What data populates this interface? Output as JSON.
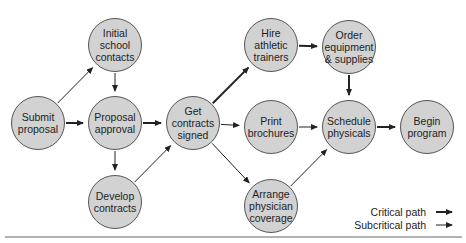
{
  "nodes": [
    {
      "id": "submit",
      "label": "Submit\nproposal",
      "cx": 38,
      "cy": 123
    },
    {
      "id": "initial",
      "label": "Initial\nschool\ncontacts",
      "cx": 115,
      "cy": 45
    },
    {
      "id": "proposal",
      "label": "Proposal\napproval",
      "cx": 115,
      "cy": 123
    },
    {
      "id": "develop",
      "label": "Develop\ncontracts",
      "cx": 115,
      "cy": 202
    },
    {
      "id": "get",
      "label": "Get\ncontracts\nsigned",
      "cx": 193,
      "cy": 123
    },
    {
      "id": "hire",
      "label": "Hire\nathletic\ntrainers",
      "cx": 271,
      "cy": 45
    },
    {
      "id": "order",
      "label": "Order\nequipment\n& supplies",
      "cx": 349,
      "cy": 47
    },
    {
      "id": "print",
      "label": "Print\nbrochures",
      "cx": 271,
      "cy": 127
    },
    {
      "id": "schedule",
      "label": "Schedule\nphysicals",
      "cx": 349,
      "cy": 127
    },
    {
      "id": "begin",
      "label": "Begin\nprogram",
      "cx": 427,
      "cy": 127
    },
    {
      "id": "arrange",
      "label": "Arrange\nphysician\ncoverage",
      "cx": 271,
      "cy": 206
    }
  ],
  "edges": [
    {
      "from": "submit",
      "to": "initial",
      "type": "subcritical"
    },
    {
      "from": "submit",
      "to": "proposal",
      "type": "critical"
    },
    {
      "from": "initial",
      "to": "proposal",
      "type": "subcritical"
    },
    {
      "from": "proposal",
      "to": "get",
      "type": "critical"
    },
    {
      "from": "proposal",
      "to": "develop",
      "type": "subcritical"
    },
    {
      "from": "develop",
      "to": "get",
      "type": "subcritical"
    },
    {
      "from": "get",
      "to": "hire",
      "type": "critical"
    },
    {
      "from": "get",
      "to": "print",
      "type": "subcritical"
    },
    {
      "from": "get",
      "to": "arrange",
      "type": "subcritical"
    },
    {
      "from": "hire",
      "to": "order",
      "type": "critical"
    },
    {
      "from": "order",
      "to": "schedule",
      "type": "critical"
    },
    {
      "from": "print",
      "to": "schedule",
      "type": "subcritical"
    },
    {
      "from": "arrange",
      "to": "schedule",
      "type": "subcritical"
    },
    {
      "from": "schedule",
      "to": "begin",
      "type": "critical"
    }
  ],
  "legend": {
    "critical": "Critical path",
    "subcritical": "Subcritical path"
  },
  "colors": {
    "node_fill": "#d2d2d2",
    "node_stroke": "#555555",
    "line": "#222222",
    "rule": "#999999"
  }
}
